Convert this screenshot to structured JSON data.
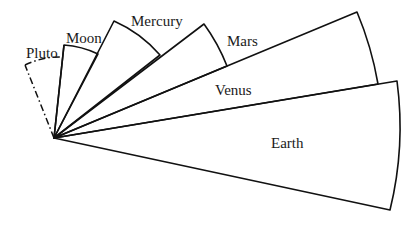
{
  "diagram": {
    "type": "fan-of-sectors",
    "apex": {
      "x": 54,
      "y": 138
    },
    "colors": {
      "stroke": "#111111",
      "hatch": "#222222",
      "background": "#ffffff"
    },
    "sectors": [
      {
        "key": "pluto",
        "label": "Pluto",
        "fill": "none",
        "outline": "dash-dot",
        "label_pos": {
          "x": 26,
          "y": 58
        }
      },
      {
        "key": "moon",
        "label": "Moon",
        "fill": "heavy-hatch",
        "outline": "solid",
        "label_pos": {
          "x": 66,
          "y": 43
        }
      },
      {
        "key": "mercury",
        "label": "Mercury",
        "fill": "none",
        "outline": "solid",
        "label_pos": {
          "x": 131,
          "y": 26
        }
      },
      {
        "key": "mars",
        "label": "Mars",
        "fill": "light-hatch-rising",
        "outline": "solid",
        "label_pos": {
          "x": 227,
          "y": 46
        }
      },
      {
        "key": "venus",
        "label": "Venus",
        "fill": "none",
        "outline": "solid",
        "label_pos": {
          "x": 215,
          "y": 95
        }
      },
      {
        "key": "earth",
        "label": "Earth",
        "fill": "light-hatch-falling",
        "outline": "solid",
        "label_pos": {
          "x": 271,
          "y": 148
        }
      }
    ]
  }
}
